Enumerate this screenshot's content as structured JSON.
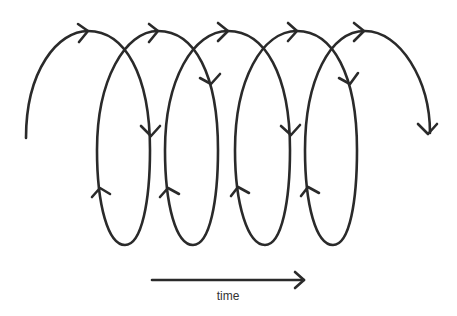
{
  "diagram": {
    "type": "spiral-loop",
    "loops": 4,
    "arrow_label": "time",
    "stroke_color": "#2a2a2a",
    "background": "#ffffff"
  }
}
